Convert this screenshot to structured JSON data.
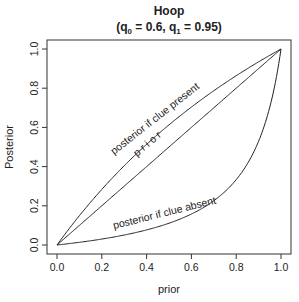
{
  "chart_data": {
    "type": "line",
    "title": "Hoop",
    "subtitle": "(q0 = 0.6, q1 = 0.95)",
    "subtitle_parts": {
      "open": "(q",
      "sub0": "0",
      "mid0": " = 0.6, q",
      "sub1": "1",
      "end": " = 0.95)"
    },
    "xlabel": "prior",
    "ylabel": "Posterior",
    "xlim": [
      0,
      1
    ],
    "ylim": [
      0,
      1
    ],
    "xticks": [
      "0.0",
      "0.2",
      "0.4",
      "0.6",
      "0.8",
      "1.0"
    ],
    "yticks": [
      "0.0",
      "0.2",
      "0.4",
      "0.6",
      "0.8",
      "1.0"
    ],
    "grid": false,
    "legend": null,
    "params": {
      "q0": 0.6,
      "q1": 0.95
    },
    "x": [
      0,
      0.1,
      0.2,
      0.3,
      0.4,
      0.5,
      0.6,
      0.7,
      0.8,
      0.9,
      1.0
    ],
    "series": [
      {
        "name": "posterior if clue present",
        "label": "posterior if clue present",
        "values": [
          0,
          0.15,
          0.284,
          0.404,
          0.514,
          0.613,
          0.704,
          0.787,
          0.864,
          0.934,
          1.0
        ]
      },
      {
        "name": "prior",
        "label": "p r i o r",
        "values": [
          0,
          0.1,
          0.2,
          0.3,
          0.4,
          0.5,
          0.6,
          0.7,
          0.8,
          0.9,
          1.0
        ]
      },
      {
        "name": "posterior if clue absent",
        "label": "posterior if clue absent",
        "values": [
          0,
          0.014,
          0.03,
          0.051,
          0.077,
          0.111,
          0.158,
          0.226,
          0.333,
          0.529,
          1.0
        ]
      }
    ]
  }
}
